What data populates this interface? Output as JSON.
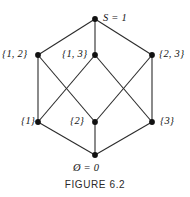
{
  "figure": {
    "caption": "FIGURE 6.2"
  },
  "diagram": {
    "type": "hasse-diagram",
    "nodes": [
      {
        "id": "top",
        "label": "S  =  1",
        "x": 95,
        "y": 19,
        "label_pos": "right"
      },
      {
        "id": "s12",
        "label": "{1, 2}",
        "x": 38,
        "y": 55,
        "label_pos": "left"
      },
      {
        "id": "s13",
        "label": "{1, 3}",
        "x": 95,
        "y": 55,
        "label_pos": "left"
      },
      {
        "id": "s23",
        "label": "{2, 3}",
        "x": 152,
        "y": 55,
        "label_pos": "right"
      },
      {
        "id": "s1",
        "label": "{1}",
        "x": 38,
        "y": 122,
        "label_pos": "left"
      },
      {
        "id": "s2",
        "label": "{2}",
        "x": 95,
        "y": 122,
        "label_pos": "left"
      },
      {
        "id": "s3",
        "label": "{3}",
        "x": 152,
        "y": 122,
        "label_pos": "right"
      },
      {
        "id": "bottom",
        "label": "Ø  =  0",
        "x": 95,
        "y": 155,
        "label_pos": "below"
      }
    ],
    "edges": [
      {
        "from": "top",
        "to": "s12"
      },
      {
        "from": "top",
        "to": "s13"
      },
      {
        "from": "top",
        "to": "s23"
      },
      {
        "from": "s12",
        "to": "s1"
      },
      {
        "from": "s12",
        "to": "s2"
      },
      {
        "from": "s13",
        "to": "s1"
      },
      {
        "from": "s13",
        "to": "s3"
      },
      {
        "from": "s23",
        "to": "s2"
      },
      {
        "from": "s23",
        "to": "s3"
      },
      {
        "from": "s1",
        "to": "bottom"
      },
      {
        "from": "s2",
        "to": "bottom"
      },
      {
        "from": "s3",
        "to": "bottom"
      }
    ],
    "colors": {
      "edge": "#2b2b2b",
      "node": "#111111",
      "text": "#141414",
      "background": "#ffffff"
    }
  }
}
